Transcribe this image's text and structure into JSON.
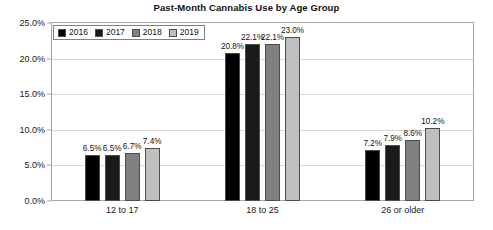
{
  "chart_data": {
    "type": "bar",
    "title": "Past-Month Cannabis Use by Age Group",
    "xlabel": "",
    "ylabel": "",
    "categories": [
      "12 to 17",
      "18 to 25",
      "26 or older"
    ],
    "series": [
      {
        "name": "2016",
        "color": "#000000",
        "values": [
          6.5,
          20.8,
          7.2
        ],
        "labels": [
          "6.5%",
          "20.8%",
          "7.2%"
        ]
      },
      {
        "name": "2017",
        "color": "#1a1a1a",
        "values": [
          6.5,
          22.1,
          7.9
        ],
        "labels": [
          "6.5%",
          "22.1%",
          "7.9%"
        ]
      },
      {
        "name": "2018",
        "color": "#808080",
        "values": [
          6.7,
          22.1,
          8.6
        ],
        "labels": [
          "6.7%",
          "22.1%",
          "8.6%"
        ]
      },
      {
        "name": "2019",
        "color": "#bfbfbf",
        "values": [
          7.4,
          23.0,
          10.2
        ],
        "labels": [
          "7.4%",
          "23.0%",
          "10.2%"
        ]
      }
    ],
    "ylim": [
      0,
      25
    ],
    "ytick_values": [
      0,
      5,
      10,
      15,
      20,
      25
    ],
    "ytick_labels": [
      "0.0%",
      "5.0%",
      "10.0%",
      "15.0%",
      "20.0%",
      "25.0%"
    ],
    "grid": true,
    "legend_position": "top-left",
    "value_labels": true
  },
  "axis": {
    "y_labels": [
      "25.0%",
      "20.0%",
      "15.0%",
      "10.0%",
      "5.0%",
      "0.0%"
    ],
    "x_labels": [
      "12 to 17",
      "18 to 25",
      "26 or older"
    ]
  },
  "legend": {
    "items": [
      {
        "label": "2016"
      },
      {
        "label": "2017"
      },
      {
        "label": "2018"
      },
      {
        "label": "2019"
      }
    ]
  }
}
